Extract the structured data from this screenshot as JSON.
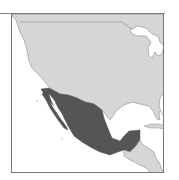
{
  "map": {
    "region": "North and Central America",
    "highlighted_country": "Mexico",
    "colors": {
      "highlight": "#555555",
      "land": "#d6d6d6",
      "water": "#ffffff",
      "border": "#8c8c8c",
      "frame": "#777777"
    },
    "labels": []
  }
}
